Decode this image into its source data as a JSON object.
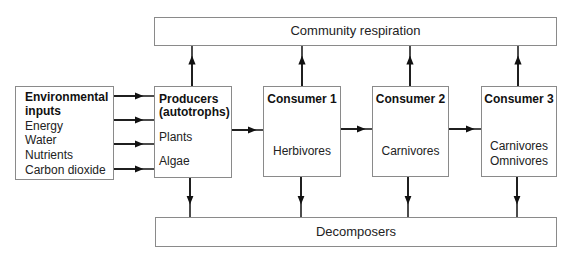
{
  "diagram": {
    "top_box": {
      "label": "Community respiration"
    },
    "bottom_box": {
      "label": "Decomposers"
    },
    "environmental_inputs": {
      "title_line1": "Environmental",
      "title_line2": "inputs",
      "items": [
        "Energy",
        "Water",
        "Nutrients",
        "Carbon dioxide"
      ]
    },
    "producers": {
      "title_line1": "Producers",
      "title_line2": "(autotrophs)",
      "items": [
        "Plants",
        "Algae"
      ]
    },
    "consumer1": {
      "title": "Consumer 1",
      "items": [
        "Herbivores"
      ]
    },
    "consumer2": {
      "title": "Consumer 2",
      "items": [
        "Carnivores"
      ]
    },
    "consumer3": {
      "title": "Consumer 3",
      "items": [
        "Carnivores",
        "Omnivores"
      ]
    },
    "edges": [
      {
        "from": "environmental_inputs",
        "to": "producers",
        "count": 4
      },
      {
        "from": "producers",
        "to": "consumer1"
      },
      {
        "from": "consumer1",
        "to": "consumer2"
      },
      {
        "from": "consumer2",
        "to": "consumer3"
      },
      {
        "from": "producers",
        "to": "top_box"
      },
      {
        "from": "consumer1",
        "to": "top_box"
      },
      {
        "from": "consumer2",
        "to": "top_box"
      },
      {
        "from": "consumer3",
        "to": "top_box"
      },
      {
        "from": "producers",
        "to": "bottom_box"
      },
      {
        "from": "consumer1",
        "to": "bottom_box"
      },
      {
        "from": "consumer2",
        "to": "bottom_box"
      },
      {
        "from": "consumer3",
        "to": "bottom_box"
      }
    ]
  }
}
